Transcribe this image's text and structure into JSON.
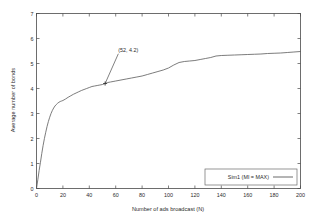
{
  "chart_data": {
    "type": "line",
    "title": "",
    "subtitle": "",
    "xlabel": "Number of ads broadcast (N)",
    "ylabel": "Average number of bonds",
    "xlim": [
      0,
      200
    ],
    "ylim": [
      0,
      7
    ],
    "grid": false,
    "legend_position": "bottom-right",
    "xticks": [
      0,
      20,
      40,
      60,
      80,
      100,
      120,
      140,
      160,
      180,
      200
    ],
    "xticklabels": [
      "0",
      "20",
      "40",
      "60",
      "80",
      "100",
      "120",
      "140",
      "160",
      "180",
      "200"
    ],
    "yticks": [
      0,
      1,
      2,
      3,
      4,
      5,
      6,
      7
    ],
    "yticklabels": [
      "0",
      "1",
      "2",
      "3",
      "4",
      "5",
      "6",
      "7"
    ],
    "series": [
      {
        "name": "Sim1 (MI = MAX)",
        "color": "#5a5a5a",
        "x": [
          0,
          1,
          2,
          3,
          4,
          5,
          6,
          7,
          8,
          9,
          10,
          11,
          12,
          13,
          14,
          15,
          16,
          17,
          18,
          19,
          20,
          22,
          24,
          26,
          28,
          30,
          32,
          34,
          36,
          38,
          40,
          42,
          44,
          46,
          48,
          50,
          52,
          54,
          56,
          58,
          60,
          64,
          68,
          72,
          76,
          80,
          84,
          88,
          92,
          96,
          100,
          104,
          108,
          112,
          116,
          120,
          124,
          128,
          132,
          136,
          140,
          145,
          150,
          155,
          160,
          165,
          170,
          175,
          180,
          185,
          190,
          195,
          200
        ],
        "y": [
          0.0,
          0.35,
          0.72,
          1.05,
          1.4,
          1.72,
          2.0,
          2.25,
          2.48,
          2.68,
          2.85,
          3.0,
          3.12,
          3.22,
          3.3,
          3.36,
          3.41,
          3.45,
          3.48,
          3.5,
          3.52,
          3.58,
          3.65,
          3.71,
          3.77,
          3.82,
          3.87,
          3.92,
          3.96,
          4.0,
          4.04,
          4.08,
          4.1,
          4.12,
          4.14,
          4.16,
          4.2,
          4.24,
          4.26,
          4.28,
          4.3,
          4.34,
          4.38,
          4.42,
          4.46,
          4.5,
          4.56,
          4.62,
          4.68,
          4.74,
          4.82,
          4.94,
          5.04,
          5.08,
          5.1,
          5.12,
          5.16,
          5.2,
          5.24,
          5.3,
          5.32,
          5.33,
          5.34,
          5.35,
          5.36,
          5.37,
          5.38,
          5.4,
          5.41,
          5.42,
          5.44,
          5.46,
          5.48
        ]
      }
    ],
    "annotations": [
      {
        "text": "(52, 4.2)",
        "point_x": 52,
        "point_y": 4.2,
        "label_x": 62,
        "label_y": 5.45
      }
    ]
  },
  "legend": {
    "entries": [
      {
        "label": "Sim1 (MI = MAX)"
      }
    ]
  },
  "axes": {
    "x_title": "Number of ads broadcast (N)",
    "y_title": "Average number of bonds"
  }
}
